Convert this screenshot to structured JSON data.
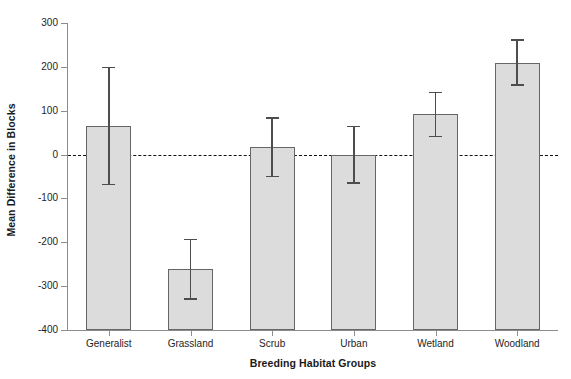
{
  "chart_data": {
    "type": "bar",
    "title": "",
    "xlabel": "Breeding Habitat Groups",
    "ylabel": "Mean Difference in Blocks",
    "categories": [
      "Generalist",
      "Grassland",
      "Scrub",
      "Urban",
      "Wetland",
      "Woodland"
    ],
    "values": [
      66,
      -262,
      18,
      -2,
      93,
      209
    ],
    "error_upper": [
      200,
      -192,
      85,
      66,
      143,
      263
    ],
    "error_lower": [
      -66,
      -328,
      -48,
      -63,
      43,
      160
    ],
    "ylim": [
      -400,
      300
    ],
    "yticks": [
      300,
      200,
      100,
      0,
      -100,
      -200,
      -300,
      -400
    ],
    "ytick_labels": [
      "300",
      "200",
      "100",
      "0",
      "-100",
      "-200",
      "-300",
      "-400"
    ],
    "grid": false,
    "legend": "none",
    "reference_line": {
      "value": 0,
      "style": "dashed",
      "color": "#111111"
    },
    "bar_baseline": -400,
    "bar_fill_color": "#dcdcdc",
    "bar_edge_color": "#666666",
    "error_bar_color": "#4d4d4d",
    "axis_color": "#8c8c8c"
  }
}
